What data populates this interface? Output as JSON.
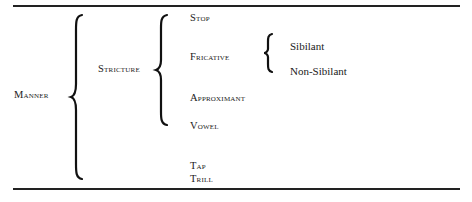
{
  "diagram": {
    "root": "Manner",
    "level1": {
      "label": "Stricture"
    },
    "stricture_items": [
      "Stop",
      "Fricative",
      "Approximant",
      "Vowel"
    ],
    "fricative_items": [
      "Sibilant",
      "Non-Sibilant"
    ],
    "manner_other_items": [
      "Tap",
      "Trill"
    ]
  }
}
